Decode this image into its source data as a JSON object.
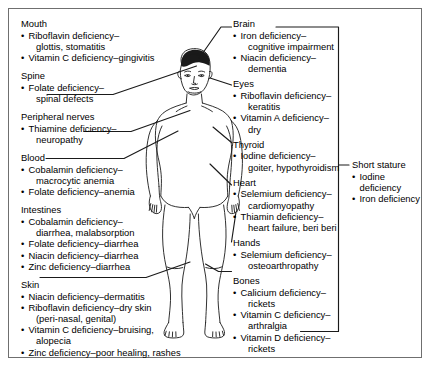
{
  "figure": {
    "alt_name": "child-body-diagram"
  },
  "left_column": [
    {
      "title": "Mouth",
      "has_leader": false,
      "items": [
        [
          "Riboflavin deficiency–",
          "glottis, stomatitis"
        ],
        [
          "Vitamin C deficiency–gingivitis"
        ]
      ]
    },
    {
      "title": "Spine",
      "has_leader": true,
      "items": [
        [
          "Folate deficiency–",
          "spinal defects"
        ]
      ]
    },
    {
      "title": "Peripheral nerves",
      "has_leader": true,
      "items": [
        [
          "Thiamine deficiency–",
          "neuropathy"
        ]
      ]
    },
    {
      "title": "Blood",
      "has_leader": true,
      "items": [
        [
          "Cobalamin deficiency–",
          "macrocytic anemia"
        ],
        [
          "Folate deficiency–anemia"
        ]
      ]
    },
    {
      "title": "Intestines",
      "has_leader": false,
      "items": [
        [
          "Cobalamin deficiency–",
          "diarrhea, malabsorption"
        ],
        [
          "Folate deficiency–diarrhea"
        ],
        [
          "Niacin deficiency–diarrhea"
        ],
        [
          "Zinc deficiency–diarrhea"
        ]
      ]
    },
    {
      "title": "Skin",
      "has_leader": true,
      "items": [
        [
          "Niacin deficiency–dermatitis"
        ],
        [
          "Riboflavin deficiency–dry skin",
          "(peri-nasal, genital)"
        ],
        [
          "Vitamin C deficiency–bruising,",
          "alopecia"
        ],
        [
          "Zinc deficiency–poor healing, rashes"
        ]
      ]
    }
  ],
  "right_column": [
    {
      "title": "Brain",
      "has_leader": true,
      "items": [
        [
          "Iron deficiency–",
          "cognitive impairment"
        ],
        [
          "Niacin deficiency–",
          "dementia"
        ]
      ]
    },
    {
      "title": "Eyes",
      "has_leader": true,
      "items": [
        [
          "Riboflavin deficiency–",
          "keratitis"
        ],
        [
          "Vitamin A deficiency–",
          "dry"
        ]
      ]
    },
    {
      "title": "Thyroid",
      "has_leader": true,
      "items": [
        [
          "Iodine deficiency–",
          "goiter, hypothyroidism"
        ]
      ]
    },
    {
      "title": "Heart",
      "has_leader": true,
      "items": [
        [
          "Selemium deficiency–",
          "cardiomyopathy"
        ],
        [
          "Thiamin deficiency–",
          "heart failure, beri beri"
        ]
      ]
    },
    {
      "title": "Hands",
      "has_leader": true,
      "items": [
        [
          "Selemium deficiency–",
          "osteoarthropathy"
        ]
      ]
    },
    {
      "title": "Bones",
      "has_leader": true,
      "items": [
        [
          "Calicium deficiency–",
          "rickets"
        ],
        [
          "Vitamin C deficiency–",
          "arthralgia"
        ],
        [
          "Vitamin D deficiency–",
          "rickets"
        ]
      ]
    }
  ],
  "short_stature": {
    "title": "Short stature",
    "items": [
      "Iodine deficiency",
      "Iron deficiency"
    ]
  },
  "colors": {
    "frame_border": "#6f6f6f",
    "text": "#000000",
    "line": "#1a1a1a",
    "background": "#ffffff"
  }
}
